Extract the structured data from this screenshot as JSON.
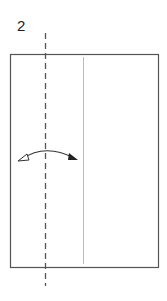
{
  "diagram": {
    "step_number": "2",
    "colors": {
      "stroke": "#555555",
      "crease": "#bbbbbb",
      "dash": "#555555"
    },
    "paper": {
      "x": 10,
      "y": 54,
      "width": 148,
      "height": 214
    },
    "valley_fold_line": {
      "x": 45,
      "y1": 33,
      "y2": 286
    },
    "crease_line": {
      "x": 83,
      "y1": 57,
      "y2": 264
    },
    "fold_arrow": {
      "from": "right",
      "to": "left",
      "type": "fold-and-unfold"
    }
  }
}
